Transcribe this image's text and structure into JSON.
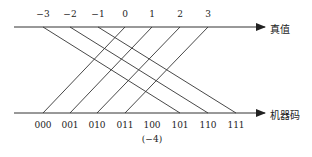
{
  "diagram": {
    "top_axis": {
      "name": "真值",
      "ticks": [
        "−3",
        "−2",
        "−1",
        "0",
        "1",
        "2",
        "3"
      ],
      "tick_x": [
        43,
        70,
        98,
        125,
        152,
        180,
        208
      ]
    },
    "bottom_axis": {
      "name": "机器码",
      "ticks": [
        "000",
        "001",
        "010",
        "011",
        "100",
        "101",
        "110",
        "111"
      ],
      "tick_x": [
        43,
        70,
        97,
        125,
        152,
        180,
        208,
        236
      ],
      "note": "(−4)"
    },
    "mapping": [
      {
        "from": "−3",
        "to": "101"
      },
      {
        "from": "−2",
        "to": "110"
      },
      {
        "from": "−1",
        "to": "111"
      },
      {
        "from": "0",
        "to": "000"
      },
      {
        "from": "1",
        "to": "001"
      },
      {
        "from": "2",
        "to": "010"
      },
      {
        "from": "3",
        "to": "011"
      }
    ],
    "line_color": "#333333"
  }
}
